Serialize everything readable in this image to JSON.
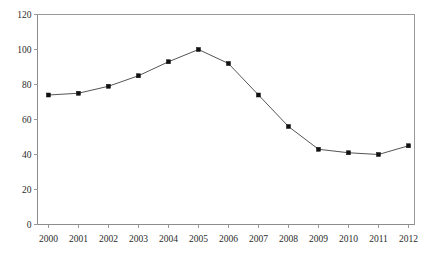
{
  "chart_data": {
    "type": "line",
    "title": "",
    "xlabel": "",
    "ylabel": "",
    "categories": [
      "2000",
      "2001",
      "2002",
      "2003",
      "2004",
      "2005",
      "2006",
      "2007",
      "2008",
      "2009",
      "2010",
      "2011",
      "2012"
    ],
    "values": [
      74,
      75,
      79,
      85,
      93,
      100,
      92,
      74,
      56,
      43,
      41,
      40,
      45
    ],
    "series": [
      {
        "name": "series-1",
        "values": [
          74,
          75,
          79,
          85,
          93,
          100,
          92,
          74,
          56,
          43,
          41,
          40,
          45
        ]
      }
    ],
    "ylim": [
      0,
      120
    ],
    "ytick_labels": [
      "0",
      "20",
      "40",
      "60",
      "80",
      "100",
      "120"
    ],
    "ytick_values": [
      0,
      20,
      40,
      60,
      80,
      100,
      120
    ],
    "xtick_labels": [
      "2000",
      "2001",
      "2002",
      "2003",
      "2004",
      "2005",
      "2006",
      "2007",
      "2008",
      "2009",
      "2010",
      "2011",
      "2012"
    ],
    "grid": false,
    "legend": null,
    "legend_position": "none",
    "marker": "square",
    "line_color": "#555555",
    "marker_color": "#111111",
    "axis_color": "#9a9a9a",
    "background_color": "#ffffff",
    "annotations": []
  }
}
